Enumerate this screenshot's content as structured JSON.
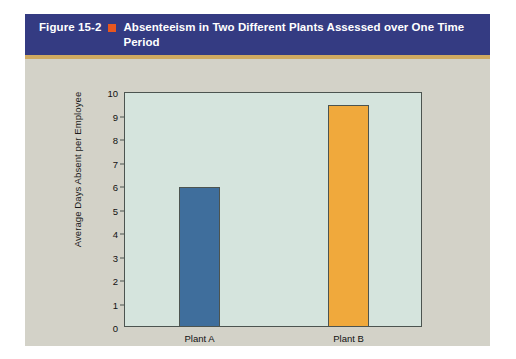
{
  "figure": {
    "number": "Figure 15-2",
    "bullet_icon": "orange-square-icon",
    "title": "Absenteeism in Two Different Plants Assessed over One Time Period",
    "header_bg": "#343b82",
    "header_rule_color": "#cfa960",
    "block_bg": "#d3d2c8",
    "bullet_color": "#e8571f"
  },
  "chart_data": {
    "type": "bar",
    "title": "Absenteeism in Two Different Plants Assessed over One Time Period",
    "categories": [
      "Plant A",
      "Plant B"
    ],
    "values": [
      5.9,
      9.4
    ],
    "series": [
      {
        "name": "Average Days Absent per Employee",
        "values": [
          5.9,
          9.4
        ]
      }
    ],
    "xlabel": "",
    "ylabel": "Average Days Absent per Employee",
    "ylim": [
      0,
      10
    ],
    "yticks": [
      10,
      9,
      8,
      7,
      6,
      5,
      4,
      3,
      2,
      1,
      0
    ],
    "ytick_labels": [
      "10",
      "9",
      "8",
      "7",
      "6",
      "5",
      "4",
      "3",
      "2",
      "1",
      "0"
    ],
    "grid": false,
    "legend": false,
    "bar_colors": [
      "#3f6e9c",
      "#f0a93c"
    ],
    "plot_bg": "#d5e4dd",
    "axis_color": "#4c5450"
  }
}
